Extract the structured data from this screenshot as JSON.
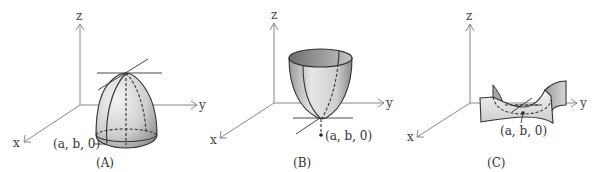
{
  "panels": [
    {
      "id": "A",
      "caption": "(A)",
      "point_label": "(a, b, 0)",
      "surface": "downward paraboloid (local maximum)",
      "axes": {
        "x": "x",
        "y": "y",
        "z": "z"
      }
    },
    {
      "id": "B",
      "caption": "(B)",
      "point_label": "(a, b, 0)",
      "surface": "upward paraboloid (local minimum)",
      "axes": {
        "x": "x",
        "y": "y",
        "z": "z"
      }
    },
    {
      "id": "C",
      "caption": "(C)",
      "point_label": "(a, b, 0)",
      "surface": "saddle surface (saddle point)",
      "axes": {
        "x": "x",
        "y": "y",
        "z": "z"
      }
    }
  ]
}
